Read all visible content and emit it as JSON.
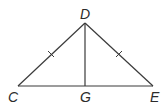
{
  "figure": {
    "type": "triangle-diagram",
    "points": {
      "D": {
        "label": "D",
        "x": 85,
        "y": 23
      },
      "C": {
        "label": "C",
        "x": 18,
        "y": 86
      },
      "G": {
        "label": "G",
        "x": 85,
        "y": 86
      },
      "E": {
        "label": "E",
        "x": 153,
        "y": 86
      }
    },
    "segments": [
      "DC",
      "DE",
      "CE",
      "DG"
    ],
    "congruent_marks": [
      "DC",
      "DE"
    ],
    "line_color": "#3a3a3a"
  }
}
